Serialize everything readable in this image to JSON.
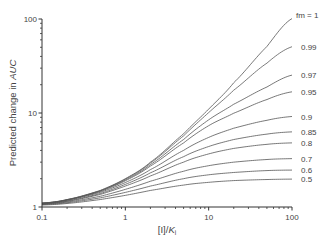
{
  "chart_data": {
    "type": "line",
    "title": "",
    "xlabel": "[I]/K_i",
    "ylabel": "Predicted change in AUC",
    "xscale": "log",
    "yscale": "log",
    "xlim": [
      0.1,
      100
    ],
    "ylim": [
      1,
      100
    ],
    "x_ticks": [
      "0.1",
      "1",
      "10",
      "100"
    ],
    "y_ticks": [
      "1",
      "10",
      "100"
    ],
    "grid": false,
    "legend": "inline labels at right end of each curve",
    "x": [
      0.1,
      0.2,
      0.5,
      1,
      2,
      5,
      10,
      20,
      50,
      100
    ],
    "series": [
      {
        "name": "fm = 1",
        "label": "fm = 1",
        "values": [
          1.1,
          1.2,
          1.5,
          2.0,
          3.0,
          6.0,
          11.0,
          21.0,
          51.0,
          101.0
        ]
      },
      {
        "name": "0.99",
        "label": "0.99",
        "values": [
          1.1,
          1.2,
          1.49,
          1.98,
          2.94,
          5.71,
          10.1,
          17.5,
          33.9,
          50.7
        ]
      },
      {
        "name": "0.97",
        "label": "0.97",
        "values": [
          1.1,
          1.19,
          1.48,
          1.94,
          2.83,
          5.22,
          8.46,
          12.4,
          18.9,
          25.3
        ]
      },
      {
        "name": "0.95",
        "label": "0.95",
        "values": [
          1.09,
          1.19,
          1.46,
          1.9,
          2.73,
          4.8,
          7.33,
          9.95,
          13.9,
          16.8
        ]
      },
      {
        "name": "0.9",
        "label": "0.9",
        "values": [
          1.09,
          1.18,
          1.43,
          1.82,
          2.5,
          4.0,
          5.5,
          6.89,
          8.36,
          9.18
        ]
      },
      {
        "name": "0.85",
        "label": "0.85",
        "values": [
          1.08,
          1.16,
          1.39,
          1.74,
          2.31,
          3.43,
          4.4,
          5.22,
          5.96,
          6.3
        ]
      },
      {
        "name": "0.8",
        "label": "0.8",
        "values": [
          1.08,
          1.15,
          1.36,
          1.67,
          2.14,
          3.0,
          3.67,
          4.2,
          4.64,
          4.81
        ]
      },
      {
        "name": "0.7",
        "label": "0.7",
        "values": [
          1.07,
          1.13,
          1.3,
          1.54,
          1.88,
          2.4,
          2.75,
          3.0,
          3.2,
          3.27
        ]
      },
      {
        "name": "0.6",
        "label": "0.6",
        "values": [
          1.06,
          1.11,
          1.25,
          1.43,
          1.67,
          2.0,
          2.2,
          2.33,
          2.44,
          2.47
        ]
      },
      {
        "name": "0.5",
        "label": "0.5",
        "values": [
          1.05,
          1.09,
          1.2,
          1.33,
          1.5,
          1.71,
          1.83,
          1.91,
          1.96,
          1.98
        ]
      }
    ]
  },
  "axes": {
    "ylabel_prefix": "Predicted change in ",
    "ylabel_italic": "AUC",
    "xlabel_main": "[I]/",
    "xlabel_italic": "K",
    "xlabel_sub": "i"
  },
  "style": {
    "axis_color": "#333333",
    "curve_colors": [
      "#555555",
      "#5a5a5a",
      "#555555",
      "#555555",
      "#555555",
      "#555555",
      "#555555",
      "#555555",
      "#555555",
      "#555555"
    ],
    "background": "#ffffff"
  }
}
